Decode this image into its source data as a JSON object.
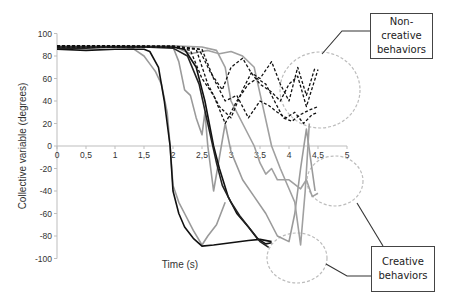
{
  "chart_data": {
    "type": "line",
    "title": "",
    "xlabel": "Time (s)",
    "ylabel": "Collective variable (degrees)",
    "xlim": [
      0,
      5
    ],
    "ylim": [
      -100,
      100
    ],
    "x_ticks": [
      "0",
      "0,5",
      "1",
      "1,5",
      "2",
      "2,5",
      "3",
      "3,5",
      "4",
      "4,5",
      "5"
    ],
    "y_ticks": [
      "100",
      "80",
      "60",
      "40",
      "20",
      "0",
      "-20",
      "-40",
      "-60",
      "-80",
      "-100"
    ],
    "grid": false,
    "legend": "none",
    "annotations": [
      {
        "label": "Non-\ncreative\nbehaviors",
        "target": "dashed trajectories ending 25–75 at t≈4.5"
      },
      {
        "label": "Creative\nbehaviors",
        "target": "trajectories ending near -40 and -90"
      }
    ],
    "series": [
      {
        "name": "creative-black-1",
        "style": "solid",
        "color": "#111111",
        "x": [
          0,
          0.5,
          1.0,
          1.5,
          1.6,
          1.75,
          1.85,
          1.95,
          2.0,
          2.1,
          2.2,
          2.35,
          2.5,
          2.7,
          3.0,
          3.3,
          3.5,
          3.7
        ],
        "y": [
          86,
          85,
          86,
          86,
          84,
          70,
          40,
          0,
          -40,
          -60,
          -72,
          -82,
          -89,
          -88,
          -86,
          -84,
          -83,
          -85
        ]
      },
      {
        "name": "creative-black-2",
        "style": "solid",
        "color": "#111111",
        "x": [
          0,
          0.5,
          1.0,
          1.5,
          2.0,
          2.2,
          2.4,
          2.55,
          2.7,
          2.8,
          2.95,
          3.1,
          3.3,
          3.45,
          3.6,
          3.7
        ],
        "y": [
          88,
          88,
          88,
          88,
          88,
          86,
          70,
          40,
          0,
          -20,
          -45,
          -60,
          -72,
          -82,
          -87,
          -86
        ]
      },
      {
        "name": "creative-black-3",
        "style": "solid",
        "color": "#222222",
        "x": [
          0,
          0.5,
          1.0,
          1.5,
          2.0,
          2.25,
          2.45,
          2.6,
          2.75,
          2.85,
          3.0,
          3.15,
          3.35,
          3.5,
          3.65
        ],
        "y": [
          87,
          87,
          88,
          88,
          87,
          80,
          55,
          20,
          -15,
          -35,
          -50,
          -62,
          -75,
          -85,
          -90
        ]
      },
      {
        "name": "creative-gray-1",
        "style": "solid",
        "color": "#9a9a9a",
        "x": [
          0,
          0.5,
          1.0,
          1.3,
          1.5,
          1.6,
          1.7,
          1.8,
          1.9,
          1.95,
          2.0,
          2.1,
          2.2,
          2.35,
          2.5,
          2.6,
          2.75,
          2.9
        ],
        "y": [
          88,
          89,
          88,
          87,
          80,
          73,
          66,
          55,
          30,
          0,
          -35,
          -50,
          -60,
          -75,
          -88,
          -80,
          -70,
          -50
        ]
      },
      {
        "name": "creative-gray-2",
        "style": "solid",
        "color": "#9a9a9a",
        "x": [
          0,
          1.0,
          2.0,
          2.1,
          2.2,
          2.3,
          2.4,
          2.5,
          2.55,
          2.6,
          2.7,
          2.8,
          2.9,
          3.0,
          3.2,
          3.4,
          3.6,
          3.8,
          4.0,
          4.1,
          4.2,
          4.3,
          4.45
        ],
        "y": [
          89,
          89,
          88,
          75,
          50,
          45,
          25,
          10,
          30,
          0,
          -40,
          -10,
          20,
          -5,
          -30,
          -45,
          -60,
          -80,
          -85,
          -60,
          -20,
          15,
          -40
        ]
      },
      {
        "name": "creative-gray-3",
        "style": "solid",
        "color": "#a0a0a0",
        "x": [
          0,
          1.0,
          2.0,
          2.5,
          2.75,
          2.9,
          3.0,
          3.2,
          3.4,
          3.5,
          3.6,
          3.7,
          3.8,
          4.0,
          4.2,
          4.3,
          4.4,
          4.5
        ],
        "y": [
          89,
          89,
          89,
          88,
          85,
          70,
          40,
          20,
          0,
          -15,
          -25,
          -20,
          -30,
          -30,
          -38,
          -30,
          -45,
          -42
        ]
      },
      {
        "name": "creative-gray-4",
        "style": "solid",
        "color": "#a0a0a0",
        "x": [
          2.0,
          2.3,
          2.6,
          2.8,
          3.0,
          3.2,
          3.4,
          3.55,
          3.7,
          3.85,
          4.0,
          4.1,
          4.2,
          4.28,
          4.35
        ],
        "y": [
          89,
          82,
          85,
          82,
          84,
          80,
          70,
          35,
          0,
          -20,
          -38,
          -50,
          -88,
          -40,
          20
        ]
      },
      {
        "name": "non-creative-dashed-1",
        "style": "dashed",
        "color": "#111111",
        "x": [
          0,
          1.0,
          2.0,
          2.3,
          2.5,
          2.7,
          2.9,
          3.1,
          3.3,
          3.45,
          3.6,
          3.75,
          3.9,
          4.05,
          4.2,
          4.35,
          4.5
        ],
        "y": [
          89,
          89,
          88,
          85,
          60,
          45,
          20,
          40,
          55,
          60,
          55,
          40,
          25,
          22,
          28,
          32,
          35
        ]
      },
      {
        "name": "non-creative-dashed-2",
        "style": "dashed",
        "color": "#111111",
        "x": [
          0,
          1.0,
          2.0,
          2.4,
          2.6,
          2.8,
          3.0,
          3.2,
          3.35,
          3.5,
          3.7,
          3.85,
          4.0,
          4.15,
          4.3,
          4.45
        ],
        "y": [
          89,
          89,
          88,
          86,
          55,
          35,
          25,
          50,
          65,
          60,
          75,
          55,
          40,
          70,
          45,
          70
        ]
      },
      {
        "name": "non-creative-dashed-3",
        "style": "dashed",
        "color": "#111111",
        "x": [
          0,
          1.0,
          2.0,
          2.5,
          2.7,
          2.9,
          3.1,
          3.3,
          3.5,
          3.65,
          3.8,
          3.95,
          4.1,
          4.25,
          4.4,
          4.5
        ],
        "y": [
          89,
          89,
          89,
          86,
          60,
          40,
          45,
          25,
          40,
          36,
          30,
          25,
          30,
          20,
          28,
          30
        ]
      },
      {
        "name": "non-creative-dashed-4",
        "style": "dashed",
        "color": "#111111",
        "x": [
          0,
          1.0,
          2.0,
          2.45,
          2.65,
          2.85,
          3.0,
          3.2,
          3.35,
          3.5,
          3.7,
          3.85,
          4.0,
          4.15,
          4.3,
          4.5
        ],
        "y": [
          88,
          88,
          88,
          86,
          65,
          50,
          70,
          78,
          65,
          55,
          48,
          40,
          55,
          62,
          35,
          68
        ]
      }
    ]
  },
  "callouts": {
    "non_creative": "Non-\ncreative\nbehaviors",
    "creative": "Creative\nbehaviors"
  },
  "colors": {
    "axis": "#bdbdbd",
    "ellipse": "#bcbcbc",
    "leader": "#333333"
  }
}
